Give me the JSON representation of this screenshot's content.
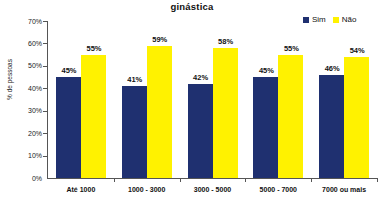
{
  "chart_data": {
    "type": "bar",
    "title": "ginástica",
    "xlabel": "",
    "ylabel": "% de pessoas",
    "ylim": [
      0,
      70
    ],
    "ytick_labels": [
      "70%",
      "60%",
      "50%",
      "40%",
      "30%",
      "20%",
      "10%",
      "0%"
    ],
    "ytick_values": [
      70,
      60,
      50,
      40,
      30,
      20,
      10,
      0
    ],
    "grid": false,
    "legend_position": "top-right",
    "categories": [
      "Até 1000",
      "1000 - 3000",
      "3000 - 5000",
      "5000 - 7000",
      "7000 ou mais"
    ],
    "series": [
      {
        "name": "Sim",
        "color": "#1F3070",
        "values": [
          45,
          41,
          42,
          45,
          46
        ],
        "labels": [
          "45%",
          "41%",
          "42%",
          "45%",
          "46%"
        ]
      },
      {
        "name": "Não",
        "color": "#FFF200",
        "values": [
          55,
          59,
          58,
          55,
          54
        ],
        "labels": [
          "55%",
          "59%",
          "58%",
          "55%",
          "54%"
        ]
      }
    ]
  },
  "colors": {
    "sim": "#1F3070",
    "nao": "#FFF200",
    "axis": "#555555",
    "text": "#111111",
    "background": "#FFFFFF"
  }
}
